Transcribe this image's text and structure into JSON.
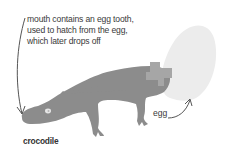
{
  "annotation": {
    "lines": [
      "mouth contains an egg tooth,",
      "used to hatch from the egg,",
      "which later drops off"
    ]
  },
  "labels": {
    "crocodile": "crocodile",
    "egg": "egg"
  },
  "colors": {
    "crocodile": "#8c8c8c",
    "egg": "#ececec",
    "shell_fragment": "#a6a6a6",
    "eye": "#e6e6e6",
    "text": "#3a3a3a",
    "arrow": "#555555"
  }
}
